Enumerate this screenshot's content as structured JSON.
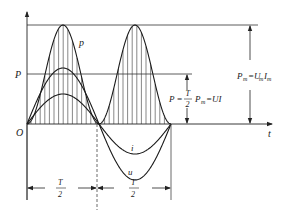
{
  "diagram": {
    "colors": {
      "curve": "#1a1a1a",
      "axis": "#222222",
      "grid_line": "#333333",
      "hatch": "#555555",
      "background": "#ffffff"
    },
    "axes": {
      "origin_label": "O",
      "t_label": "t"
    },
    "curves": [
      {
        "name": "p",
        "label": "p",
        "description": "instantaneous power, always positive, frequency 2f"
      },
      {
        "name": "u",
        "label": "u",
        "description": "voltage sinusoid (larger amplitude)"
      },
      {
        "name": "i",
        "label": "i",
        "description": "current sinusoid (smaller amplitude), in phase with u"
      }
    ],
    "labels": {
      "avg_power_left": "P",
      "avg_power_eq": {
        "lhs": "P =",
        "frac_num": "T",
        "frac_den": "2",
        "rhs_pm": "P",
        "rhs_pm_sub": "m",
        "rhs_tail": "=UI"
      },
      "peak_power_eq": {
        "p": "P",
        "p_sub": "m",
        "eq": "=U",
        "u_sub": "m",
        "i": "I",
        "i_sub": "m"
      },
      "half_period_1": {
        "num": "T",
        "den": "2"
      },
      "half_period_2": {
        "num": "T",
        "den": "2"
      }
    }
  }
}
